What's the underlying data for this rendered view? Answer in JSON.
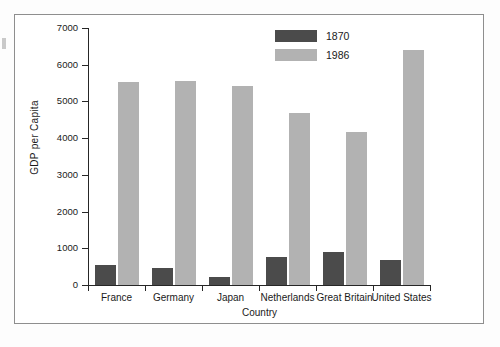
{
  "chart_data": {
    "type": "bar",
    "title": "",
    "xlabel": "Country",
    "ylabel": "GDP per Capita",
    "categories": [
      "France",
      "Germany",
      "Japan",
      "Netherlands",
      "Great Britain",
      "United States"
    ],
    "series": [
      {
        "name": "1870",
        "color": "#4b4b4b",
        "values": [
          540,
          450,
          230,
          760,
          890,
          680
        ]
      },
      {
        "name": "1986",
        "color": "#b2b2b2",
        "values": [
          5530,
          5560,
          5410,
          4690,
          4180,
          6410
        ]
      }
    ],
    "ylim": [
      0,
      7000
    ],
    "yticks": [
      0,
      1000,
      2000,
      3000,
      4000,
      5000,
      6000,
      7000
    ],
    "ytick_labels": [
      "0",
      "1000",
      "2000",
      "3000",
      "4000",
      "5000",
      "6000",
      "7000"
    ],
    "grid": false,
    "legend_position": "top-right",
    "legend_entries": [
      "1870",
      "1986"
    ]
  },
  "colors": {
    "series_1870": "#4b4b4b",
    "series_1986": "#b2b2b2",
    "axis": "#262626",
    "frame": "#8e8e8e",
    "background": "#ffffff"
  }
}
